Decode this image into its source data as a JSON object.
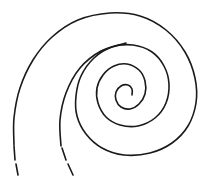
{
  "diagram": {
    "type": "spiral",
    "turns": 3.5,
    "direction": "clockwise-inward",
    "dashed_tail": true,
    "colors": {
      "stroke": "#1a1a1a",
      "background": "#ffffff"
    }
  }
}
